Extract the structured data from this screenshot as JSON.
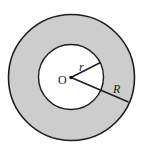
{
  "diagram": {
    "type": "annulus",
    "center": {
      "x": 71.5,
      "y": 77.5
    },
    "outer_radius": 63,
    "inner_radius": 32.5,
    "colors": {
      "ring_fill": "#cdcdcd",
      "inner_fill": "#ffffff",
      "stroke": "#1e1e1e",
      "background": "#ffffff"
    },
    "labels": {
      "center": "O",
      "inner_radius": "r",
      "outer_radius": "R"
    },
    "segments": {
      "r_line": {
        "x1": 71.5,
        "y1": 77.5,
        "x2": 100,
        "y2": 63
      },
      "R_line": {
        "x1": 71.5,
        "y1": 77.5,
        "x2": 128,
        "y2": 102
      }
    }
  }
}
